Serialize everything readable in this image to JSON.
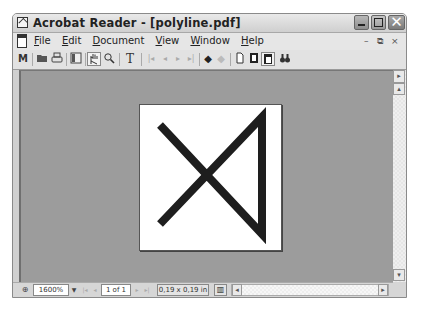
{
  "window": {
    "title": "Acrobat Reader - [polyline.pdf]",
    "controls": {
      "minimize": "minimize-button",
      "maximize": "maximize-button",
      "close": "✕"
    }
  },
  "menubar": {
    "items": [
      {
        "label_ul": "F",
        "label_rest": "ile"
      },
      {
        "label_ul": "E",
        "label_rest": "dit"
      },
      {
        "label_ul": "D",
        "label_rest": "ocument"
      },
      {
        "label_ul": "V",
        "label_rest": "iew"
      },
      {
        "label_ul": "W",
        "label_rest": "indow"
      },
      {
        "label_ul": "H",
        "label_rest": "elp"
      }
    ],
    "mdi_controls": {
      "minimize": "–",
      "restore": "⧉",
      "close": "×"
    }
  },
  "toolbar": {
    "icons": [
      {
        "name": "show-navigation-icon",
        "glyph": "⅄"
      },
      {
        "name": "open-icon",
        "glyph": "📂"
      },
      {
        "name": "print-icon",
        "glyph": "🖶"
      },
      {
        "name": "bookmarks-pane-icon",
        "glyph": "▤"
      },
      {
        "name": "hand-tool-icon",
        "glyph": "✋"
      },
      {
        "name": "zoom-tool-icon",
        "glyph": "🔍"
      },
      {
        "name": "text-select-icon",
        "glyph": "T"
      },
      {
        "name": "first-page-icon",
        "glyph": "|◂"
      },
      {
        "name": "previous-page-icon",
        "glyph": "◂"
      },
      {
        "name": "next-page-icon",
        "glyph": "▸"
      },
      {
        "name": "last-page-icon",
        "glyph": "▸|"
      },
      {
        "name": "go-back-icon",
        "glyph": "◆"
      },
      {
        "name": "go-forward-icon",
        "glyph": "◆"
      },
      {
        "name": "actual-size-icon",
        "glyph": "🗋"
      },
      {
        "name": "fit-page-icon",
        "glyph": "🗋"
      },
      {
        "name": "fit-width-icon",
        "glyph": "🗋"
      },
      {
        "name": "find-icon",
        "glyph": "🔭"
      }
    ]
  },
  "document": {
    "polyline_points": "20,20 122,129 122,12 20,119",
    "stroke_color": "#1e1e1e",
    "page_color": "#ffffff",
    "background_color": "#9c9c9c"
  },
  "statusbar": {
    "zoom_value": "1600%",
    "page_indicator": "1 of 1",
    "page_size": "0,19 x 0,19 in"
  },
  "scrollbars": {
    "vertical_up": "▴",
    "vertical_down": "▾",
    "horizontal_left": "◂",
    "horizontal_right": "▸",
    "side_toggle": "▸"
  }
}
